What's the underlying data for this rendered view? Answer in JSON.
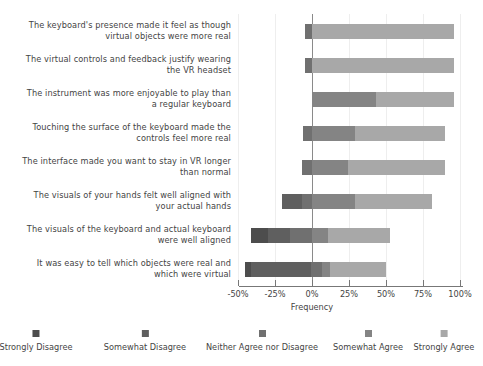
{
  "chart_data": {
    "type": "bar",
    "subtype": "diverging-stacked-likert",
    "title": "",
    "xlabel": "Frequency",
    "ylabel": "",
    "xlim": [
      -50,
      100
    ],
    "xticks": [
      -50,
      -25,
      0,
      25,
      50,
      75,
      100
    ],
    "xticklabels": [
      "-50%",
      "-25%",
      "0%",
      "25%",
      "50%",
      "75%",
      "100%"
    ],
    "grid": true,
    "legend_position": "bottom",
    "categories": [
      "The keyboard's presence made it feel as though virtual objects were more real",
      "The virtual controls and feedback justify wearing the VR headset",
      "The instrument was more enjoyable to play than a regular keyboard",
      "Touching the surface of the keyboard made the controls feel more real",
      "The interface made you want to stay in VR longer than normal",
      "The visuals of your hands felt well aligned with your actual hands",
      "The visuals of the keyboard and actual keyboard were well aligned",
      "It was easy to tell which objects were real and which were virtual"
    ],
    "category_lines": [
      [
        "The keyboard's presence made it feel as though",
        "virtual objects were more real"
      ],
      [
        "The virtual controls and feedback justify wearing",
        "the VR headset"
      ],
      [
        "The instrument was more enjoyable to play than",
        "a regular keyboard"
      ],
      [
        "Touching the surface of the keyboard made the",
        "controls feel more real"
      ],
      [
        "The interface made you want to stay in VR longer",
        "than normal"
      ],
      [
        "The visuals of your hands felt well aligned with",
        "your actual hands"
      ],
      [
        "The visuals of the keyboard and actual keyboard",
        "were well aligned"
      ],
      [
        "It was easy to tell which objects were real and",
        "which were virtual"
      ]
    ],
    "series": [
      {
        "name": "Strongly Disagree",
        "color": "#4d4d4d",
        "values": [
          0,
          0,
          0,
          0,
          0,
          0,
          11,
          4
        ]
      },
      {
        "name": "Somewhat Disagree",
        "color": "#5f5f5f",
        "values": [
          0,
          0,
          0,
          0,
          0,
          13,
          15,
          40
        ]
      },
      {
        "name": "Neither Agree nor Disagree",
        "color": "#707070",
        "values": [
          5,
          5,
          0,
          6,
          7,
          7,
          15,
          8
        ]
      },
      {
        "name": "Somewhat Agree",
        "color": "#848484",
        "values": [
          0,
          0,
          43,
          29,
          24,
          29,
          11,
          5
        ]
      },
      {
        "name": "Strongly Agree",
        "color": "#a8a8a8",
        "values": [
          96,
          96,
          53,
          61,
          66,
          52,
          42,
          38
        ]
      }
    ],
    "bar_starts_pct": [
      -5,
      -5,
      0,
      -6,
      -7,
      -20,
      -41,
      -45
    ],
    "axis_geometry": {
      "zero_x_px": 312,
      "px_per_pct": 1.48
    }
  },
  "legend": {
    "items": [
      {
        "label": "Strongly Disagree",
        "color": "#4d4d4d",
        "x": 36
      },
      {
        "label": "Somewhat Disagree",
        "color": "#5f5f5f",
        "x": 145
      },
      {
        "label": "Neither Agree nor Disagree",
        "color": "#707070",
        "x": 262
      },
      {
        "label": "Somewhat Agree",
        "color": "#848484",
        "x": 368
      },
      {
        "label": "Strongly Agree",
        "color": "#a8a8a8",
        "x": 444
      }
    ]
  }
}
